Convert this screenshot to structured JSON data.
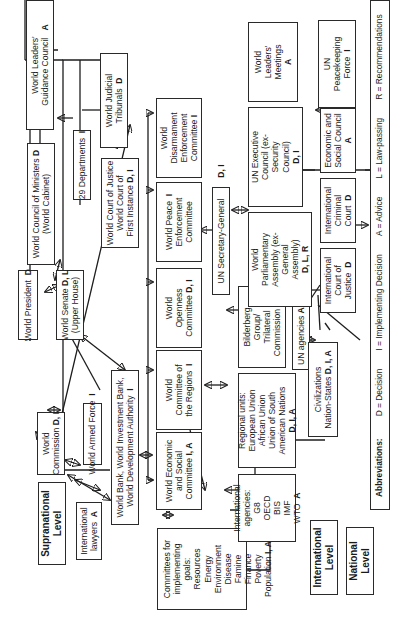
{
  "diagram": {
    "orientation": "rotated 90 degrees counter-clockwise",
    "levels": [
      {
        "id": "supranational",
        "label_1": "Supranational",
        "label_2": "Level"
      },
      {
        "id": "international",
        "label_1": "International",
        "label_2": "Level"
      },
      {
        "id": "national",
        "label_1": "National",
        "label_2": "Level"
      }
    ],
    "nodes": {
      "leaders_council": {
        "lines": [
          "World Leaders'",
          "Guidance Council"
        ],
        "code": "A"
      },
      "council_ministers": {
        "lines": [
          "World Council of Ministers",
          "(World Cabinet)"
        ],
        "code": "D"
      },
      "president": {
        "lines": [
          "World President"
        ],
        "code": "D"
      },
      "commission": {
        "lines": [
          "World",
          "Commission"
        ],
        "code": "D, I"
      },
      "intl_lawyers": {
        "lines": [
          "International",
          "lawyers"
        ],
        "code": "A"
      },
      "departments": {
        "lines": [
          "29 Departments"
        ],
        "code": "I"
      },
      "senate": {
        "lines": [
          "World Senate",
          "(Upper House)"
        ],
        "code": "D, L"
      },
      "armed_force": {
        "lines": [
          "World Armed Force"
        ],
        "code": "I"
      },
      "world_bank": {
        "lines": [
          "World Bank, World Investment Bank,",
          "World Development Authority"
        ],
        "code": "I"
      },
      "judicial_tribunals": {
        "lines": [
          "World Judicial",
          "Tribunals"
        ],
        "code": "D"
      },
      "court_justice": {
        "lines": [
          "World Court of Justice",
          "World Court of",
          "First Instance"
        ],
        "code": "D, I"
      },
      "disarmament": {
        "lines": [
          "World",
          "Disarmament",
          "Enforcement",
          "Committee"
        ],
        "code": "I"
      },
      "peace_enforcement": {
        "lines": [
          "World Peace",
          "Enforcement",
          "Committee"
        ],
        "code": "I"
      },
      "openness": {
        "lines": [
          "World",
          "Openness",
          "Committee"
        ],
        "code": "D, I"
      },
      "regions": {
        "lines": [
          "World",
          "Committee of",
          "the Regions"
        ],
        "code": "I"
      },
      "econ_social_committee": {
        "lines": [
          "World Economic",
          "and Social",
          "Committee"
        ],
        "code": "I, A"
      },
      "committees_goals": {
        "lines": [
          "Committees for",
          "implementing",
          "goals:",
          "Resources",
          "Energy",
          "Environment",
          "Disease",
          "Famine",
          "Finance",
          "Poverty",
          "Population"
        ],
        "code": "I, A"
      },
      "un_secretary": {
        "lines": [
          "UN Secretary-General"
        ],
        "code": "D, I"
      },
      "bilderberg": {
        "lines": [
          "Bilderberg",
          "Group/",
          "Trilateral",
          "Commission"
        ],
        "code": "A"
      },
      "regional_units": {
        "lines": [
          "Regional units:",
          "European Union",
          "African Union",
          "Union of South",
          "American Nations"
        ],
        "code": "D, I, A"
      },
      "intl_agencies": {
        "lines": [
          "International",
          "agencies:",
          "G8",
          "OECD",
          "BIS",
          "IMF",
          "WTO"
        ],
        "code": "A"
      },
      "un_agencies": {
        "lines": [
          "UN agencies"
        ],
        "code": "A, I"
      },
      "leaders_meetings": {
        "lines": [
          "World",
          "Leaders'",
          "Meetings"
        ],
        "code": "A"
      },
      "un_executive": {
        "lines": [
          "UN Executive",
          "Council (ex-",
          "Security",
          "Council)"
        ],
        "code": "D, I"
      },
      "parliamentary": {
        "lines": [
          "World",
          "Parliamentary",
          "Assembly (ex-",
          "General",
          "Assembly)"
        ],
        "code": "D, L, R"
      },
      "civilizations": {
        "lines": [
          "Civilizations",
          "Nation-States"
        ],
        "code": "D, I, A"
      },
      "peacekeeping": {
        "lines": [
          "UN",
          "Peacekeeping",
          "Force"
        ],
        "code": "I"
      },
      "ecosoc": {
        "lines": [
          "Economic and",
          "Social Council"
        ],
        "code": "A"
      },
      "icc": {
        "lines": [
          "International",
          "Criminal",
          "Court"
        ],
        "code": "D"
      },
      "icj": {
        "lines": [
          "International",
          "Court of",
          "Justice"
        ],
        "code": "D"
      }
    },
    "legend": {
      "title": "Abbreviations:",
      "items": [
        {
          "key": "D",
          "meaning": "Decision",
          "text": "D = Decision"
        },
        {
          "key": "I",
          "meaning": "Implementing Decision",
          "text": "I = Implementing Decision"
        },
        {
          "key": "A",
          "meaning": "Advice",
          "text": "A = Advice"
        },
        {
          "key": "L",
          "meaning": "Law-passing",
          "text": "L = Law-passing"
        },
        {
          "key": "R",
          "meaning": "Recommendations",
          "text": "R = Recommendations"
        }
      ]
    },
    "colors": {
      "line": "#1e1e1e",
      "box_border": "#2a2a2a",
      "background": "#ffffff",
      "text": "#1a1a1a"
    }
  }
}
